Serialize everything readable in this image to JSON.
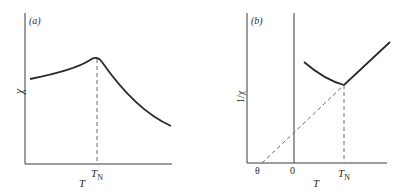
{
  "figure": {
    "panel_a": {
      "tag": "(a)",
      "ylabel": "χ",
      "xlabel": "T",
      "tick_labels": {
        "TN_main": "T",
        "TN_sub": "N"
      },
      "description": "Susceptibility χ vs temperature T showing cusp at Néel temperature T_N"
    },
    "panel_b": {
      "tag": "(b)",
      "ylabel": "1/χ",
      "xlabel": "T",
      "tick_labels": {
        "theta": "θ",
        "zero": "0",
        "TN_main": "T",
        "TN_sub": "N"
      },
      "description": "Inverse susceptibility 1/χ vs T; linear high-T part extrapolates (dashed) to negative intercept θ"
    },
    "colors": {
      "line": "#2a2a2a",
      "dashed": "#6a6a6a",
      "background": "#ffffff"
    }
  }
}
